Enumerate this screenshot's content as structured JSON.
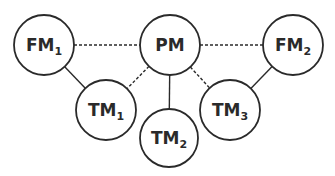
{
  "diagram": {
    "nodes": [
      {
        "id": "FM1",
        "base": "FM",
        "sub": "1",
        "cx": 44,
        "cy": 45,
        "r": 30
      },
      {
        "id": "PM",
        "base": "PM",
        "sub": "",
        "cx": 170,
        "cy": 45,
        "r": 30
      },
      {
        "id": "FM2",
        "base": "FM",
        "sub": "2",
        "cx": 293,
        "cy": 45,
        "r": 30
      },
      {
        "id": "TM1",
        "base": "TM",
        "sub": "1",
        "cx": 106,
        "cy": 110,
        "r": 30
      },
      {
        "id": "TM2",
        "base": "TM",
        "sub": "2",
        "cx": 169,
        "cy": 138,
        "r": 29
      },
      {
        "id": "TM3",
        "base": "TM",
        "sub": "3",
        "cx": 230,
        "cy": 110,
        "r": 30
      }
    ],
    "edges": [
      {
        "from": "FM1",
        "to": "PM",
        "style": "dashed"
      },
      {
        "from": "PM",
        "to": "FM2",
        "style": "dashed"
      },
      {
        "from": "FM1",
        "to": "TM1",
        "style": "solid"
      },
      {
        "from": "PM",
        "to": "TM1",
        "style": "dashed"
      },
      {
        "from": "PM",
        "to": "TM2",
        "style": "solid"
      },
      {
        "from": "PM",
        "to": "TM3",
        "style": "dashed"
      },
      {
        "from": "FM2",
        "to": "TM3",
        "style": "solid"
      }
    ],
    "colors": {
      "stroke": "#2a2a2a",
      "fill": "#ffffff",
      "text": "#2a2a2a"
    }
  }
}
